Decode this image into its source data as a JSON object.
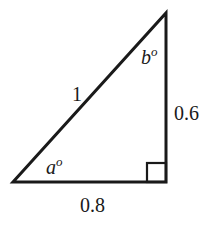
{
  "diagram": {
    "type": "right-triangle",
    "vertices": {
      "top": [
        166,
        13
      ],
      "bottom_left": [
        13,
        182
      ],
      "bottom_right": [
        166,
        182
      ]
    },
    "right_angle_marker": {
      "x": 147,
      "y": 163,
      "size": 19
    },
    "stroke_color": "#1a1a1a",
    "labels": {
      "hypotenuse": "1",
      "vertical_side": "0.6",
      "horizontal_side": "0.8",
      "angle_a": "a",
      "angle_a_degree": "o",
      "angle_b": "b",
      "angle_b_degree": "o"
    }
  }
}
